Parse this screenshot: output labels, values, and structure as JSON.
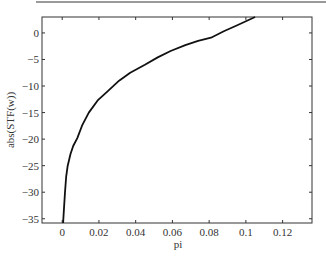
{
  "chart_data": {
    "type": "line",
    "title": "",
    "xlabel": "pi",
    "ylabel": "abs(STF(w))",
    "xlim": [
      -0.011,
      0.136
    ],
    "ylim": [
      -35.8,
      3.0
    ],
    "xticks": [
      0,
      0.02,
      0.04,
      0.06,
      0.08,
      0.1,
      0.12
    ],
    "xtick_labels": [
      "0",
      "0.02",
      "0.04",
      "0.06",
      "0.08",
      "0.1",
      "0.12"
    ],
    "yticks": [
      0,
      -5,
      -10,
      -15,
      -20,
      -25,
      -30,
      -35
    ],
    "ytick_labels": [
      "0",
      "-5",
      "-10",
      "-15",
      "-20",
      "-25",
      "-30",
      "-35"
    ],
    "grid": false,
    "legend": null,
    "series": [
      {
        "name": "abs(STF(w))",
        "color": "#111111",
        "x": [
          0.0005,
          0.001,
          0.0015,
          0.0022,
          0.003,
          0.0045,
          0.006,
          0.0082,
          0.011,
          0.0145,
          0.0196,
          0.025,
          0.031,
          0.037,
          0.045,
          0.052,
          0.059,
          0.067,
          0.074,
          0.081,
          0.088,
          0.095,
          0.1,
          0.105
        ],
        "y": [
          -35.8,
          -33.0,
          -30.0,
          -27.0,
          -25.0,
          -22.8,
          -21.3,
          -19.8,
          -17.3,
          -15.0,
          -12.6,
          -10.9,
          -9.0,
          -7.5,
          -6.0,
          -4.6,
          -3.4,
          -2.3,
          -1.5,
          -0.9,
          0.3,
          1.4,
          2.2,
          3.0
        ]
      }
    ]
  }
}
